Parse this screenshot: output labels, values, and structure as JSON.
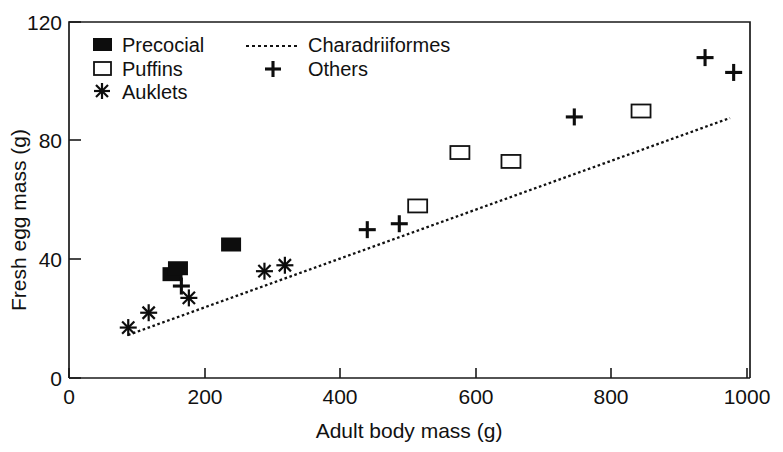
{
  "chart_data": {
    "type": "scatter",
    "title": "",
    "xlabel": "Adult body mass (g)",
    "ylabel": "Fresh egg mass (g)",
    "xlim": [
      0,
      1000
    ],
    "ylim": [
      0,
      120
    ],
    "xticks": [
      0,
      200,
      400,
      600,
      800,
      1000
    ],
    "yticks": [
      0,
      40,
      80,
      120
    ],
    "xtick_labels": [
      "0",
      "200",
      "400",
      "600",
      "800",
      "1000"
    ],
    "ytick_labels": [
      "0",
      "40",
      "80",
      "120"
    ],
    "grid": false,
    "legend_position": "top-left-inside",
    "series": [
      {
        "name": "Precocial",
        "marker": "filled-square",
        "points": [
          {
            "x": 152,
            "y": 35
          },
          {
            "x": 160,
            "y": 37
          },
          {
            "x": 238,
            "y": 45
          }
        ]
      },
      {
        "name": "Puffins",
        "marker": "open-square",
        "points": [
          {
            "x": 512,
            "y": 58
          },
          {
            "x": 574,
            "y": 76
          },
          {
            "x": 649,
            "y": 73
          },
          {
            "x": 840,
            "y": 90
          }
        ]
      },
      {
        "name": "Auklets",
        "marker": "asterisk",
        "points": [
          {
            "x": 87,
            "y": 17
          },
          {
            "x": 117,
            "y": 22
          },
          {
            "x": 176,
            "y": 27
          },
          {
            "x": 287,
            "y": 36
          },
          {
            "x": 317,
            "y": 38
          }
        ]
      },
      {
        "name": "Others",
        "marker": "plus",
        "points": [
          {
            "x": 165,
            "y": 31
          },
          {
            "x": 438,
            "y": 50
          },
          {
            "x": 485,
            "y": 52
          },
          {
            "x": 742,
            "y": 88
          },
          {
            "x": 934,
            "y": 108
          },
          {
            "x": 976,
            "y": 103
          }
        ]
      }
    ],
    "trendline": {
      "name": "Charadriiformes",
      "style": "dotted",
      "points": [
        {
          "x": 87,
          "y": 14.5
        },
        {
          "x": 978,
          "y": 87.6
        }
      ]
    },
    "legend": [
      {
        "label": "Precocial",
        "marker": "filled-square"
      },
      {
        "label": "Puffins",
        "marker": "open-square"
      },
      {
        "label": "Auklets",
        "marker": "asterisk"
      },
      {
        "label": "Charadriiformes",
        "marker": "dotted-line"
      },
      {
        "label": "Others",
        "marker": "plus"
      }
    ]
  }
}
